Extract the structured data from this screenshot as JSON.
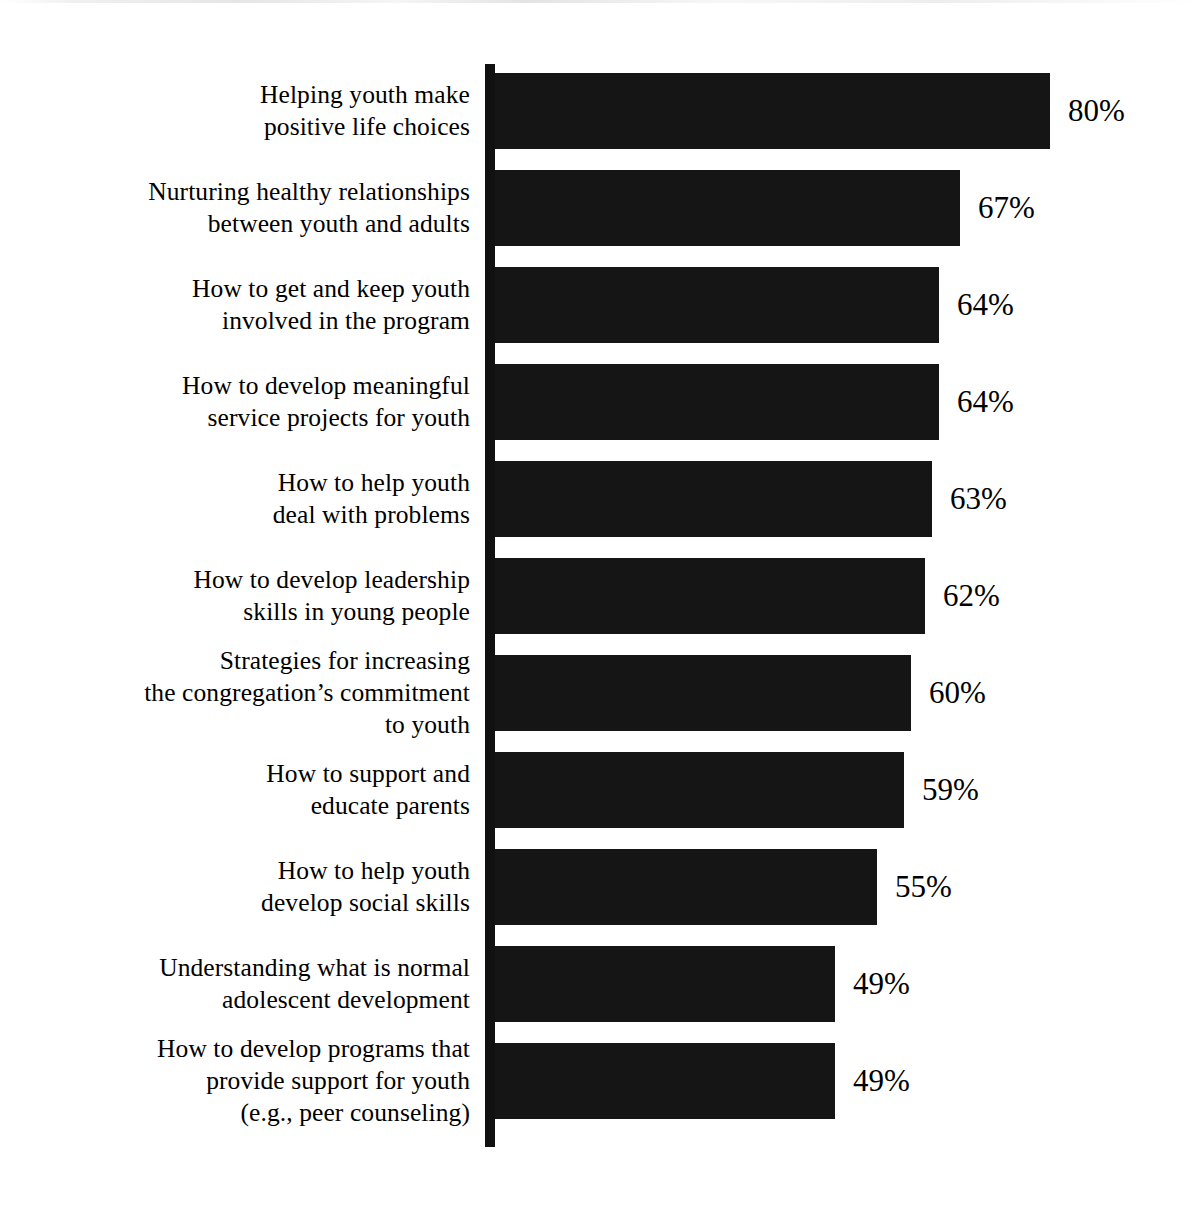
{
  "chart_data": {
    "type": "bar",
    "orientation": "horizontal",
    "title": "",
    "subtitle": "",
    "xlabel": "",
    "ylabel": "",
    "xlim": [
      0,
      100
    ],
    "grid": false,
    "legend": null,
    "value_suffix": "%",
    "categories": [
      "Helping youth make\npositive life choices",
      "Nurturing healthy relationships\nbetween youth and adults",
      "How to get and keep youth\ninvolved in the program",
      "How to develop meaningful\nservice projects for youth",
      "How to help youth\ndeal with problems",
      "How to develop leadership\nskills in young people",
      "Strategies for increasing\nthe congregation’s commitment\nto youth",
      "How to support and\neducate parents",
      "How to help youth\ndevelop social skills",
      "Understanding what is normal\nadolescent development",
      "How to develop programs that\nprovide support for youth\n(e.g., peer counseling)"
    ],
    "values": [
      80,
      67,
      64,
      64,
      63,
      62,
      60,
      59,
      55,
      49,
      49
    ],
    "value_labels": [
      "80%",
      "67%",
      "64%",
      "64%",
      "63%",
      "62%",
      "60%",
      "59%",
      "55%",
      "49%",
      "49%"
    ],
    "bar_color": "#151515",
    "axis_color": "#111111",
    "background_color": "#ffffff"
  },
  "layout": {
    "axis_x": 485,
    "bar_start_x": 495,
    "px_per_percent": 6.94,
    "first_bar_top": 73,
    "bar_height": 76,
    "row_pitch": 97,
    "label_right_edge": 470,
    "value_gap": 18
  }
}
